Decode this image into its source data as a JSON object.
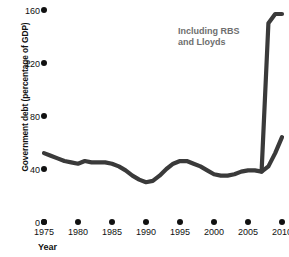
{
  "chart_data": {
    "type": "line",
    "title": "",
    "xlabel": "Year",
    "ylabel": "Government debt (percentage of GDP)",
    "xlim": [
      1975,
      2010
    ],
    "ylim": [
      0,
      160
    ],
    "grid": false,
    "legend": null,
    "xticks": [
      "1975",
      "1980",
      "1985",
      "1990",
      "1995",
      "2000",
      "2005",
      "2010"
    ],
    "xtick_values": [
      1975,
      1980,
      1985,
      1990,
      1995,
      2000,
      2005,
      2010
    ],
    "yticks": [
      "0",
      "40",
      "80",
      "120",
      "160"
    ],
    "ytick_values": [
      0,
      40,
      80,
      120,
      160
    ],
    "series": [
      {
        "name": "Government debt (excluding RBS and Lloyds)",
        "x": [
          1975,
          1976,
          1977,
          1978,
          1979,
          1980,
          1981,
          1982,
          1983,
          1984,
          1985,
          1986,
          1987,
          1988,
          1989,
          1990,
          1991,
          1992,
          1993,
          1994,
          1995,
          1996,
          1997,
          1998,
          1999,
          2000,
          2001,
          2002,
          2003,
          2004,
          2005,
          2006,
          2007,
          2008,
          2009,
          2010
        ],
        "values": [
          52,
          50,
          48,
          46,
          45,
          44,
          46,
          45,
          45,
          45,
          44,
          42,
          39,
          35,
          32,
          30,
          31,
          35,
          40,
          44,
          46,
          46,
          44,
          42,
          39,
          36,
          35,
          35,
          36,
          38,
          39,
          39,
          38,
          42,
          52,
          64
        ]
      },
      {
        "name": "Including RBS and Lloyds",
        "x": [
          2007,
          2008,
          2009,
          2010
        ],
        "values": [
          38,
          150,
          157,
          157
        ]
      }
    ],
    "annotations": [
      {
        "text": "Including RBS\nand Lloyds",
        "x": 2006,
        "y": 135,
        "color": "#6e6e6e"
      }
    ],
    "colors": {
      "line": "#3a3a3a",
      "tick_dot": "#111111",
      "text": "#111111",
      "annotation": "#6e6e6e",
      "background": "#ffffff"
    }
  }
}
